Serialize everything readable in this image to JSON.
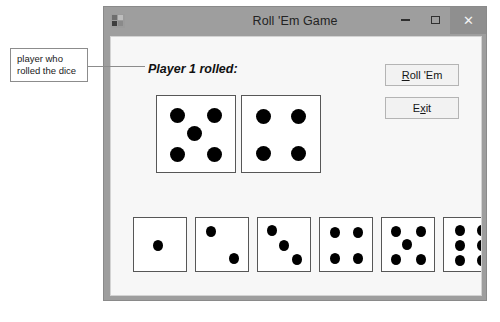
{
  "annotation": {
    "text": "player who\nrolled the dice",
    "line1": "player who",
    "line2": "rolled the dice"
  },
  "window": {
    "title": "Roll 'Em Game",
    "icon": "app-icon",
    "caption_buttons": {
      "minimize": "–",
      "maximize": "❐",
      "close": "✕"
    },
    "colors": {
      "title_bar": "#9e9e9e",
      "client": "#f7f7f7",
      "close_button": "#8f8f8f",
      "border": "#8a8a8a"
    }
  },
  "main": {
    "player_label": "Player 1 rolled:",
    "buttons": [
      {
        "name": "roll-em-button",
        "prefix": "",
        "accel": "R",
        "suffix": "oll 'Em"
      },
      {
        "name": "exit-button",
        "prefix": "E",
        "accel": "x",
        "suffix": "it"
      }
    ],
    "rolled_dice": [
      {
        "name": "die-big-1",
        "value": 5
      },
      {
        "name": "die-big-2",
        "value": 4
      }
    ],
    "dice_gallery": [
      {
        "name": "die-small-1",
        "value": 1
      },
      {
        "name": "die-small-2",
        "value": 2
      },
      {
        "name": "die-small-3",
        "value": 3
      },
      {
        "name": "die-small-4",
        "value": 4
      },
      {
        "name": "die-small-5",
        "value": 5
      },
      {
        "name": "die-small-6",
        "value": 6
      }
    ]
  }
}
